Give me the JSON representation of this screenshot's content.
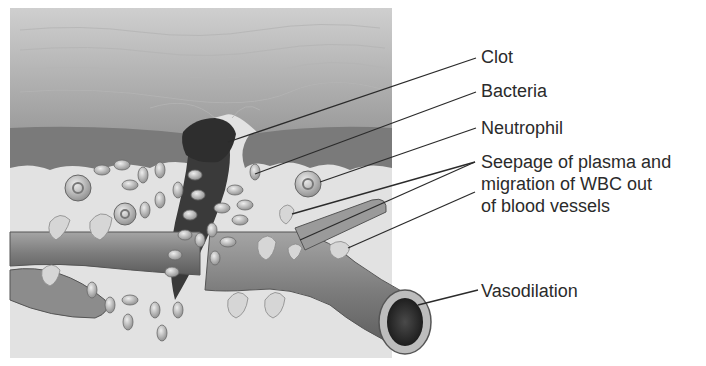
{
  "figure": {
    "labels": [
      {
        "id": "clot",
        "text": "Clot"
      },
      {
        "id": "bacteria",
        "text": "Bacteria"
      },
      {
        "id": "neutrophil",
        "text": "Neutrophil"
      },
      {
        "id": "seepage",
        "lines": [
          "Seepage of plasma and",
          "migration of WBC out",
          "of blood vessels"
        ]
      },
      {
        "id": "vasodilation",
        "text": "Vasodilation"
      }
    ]
  },
  "colors": {
    "background": "#ffffff",
    "epidermis": "#a8a8a8",
    "dermis_dark": "#6e6e6e",
    "tissue": "#d8d8d8",
    "clot": "#2e2e2e",
    "vessel": "#8a8a8a",
    "label_text": "#2b2b2b",
    "leader_line": "#2b2b2b"
  }
}
